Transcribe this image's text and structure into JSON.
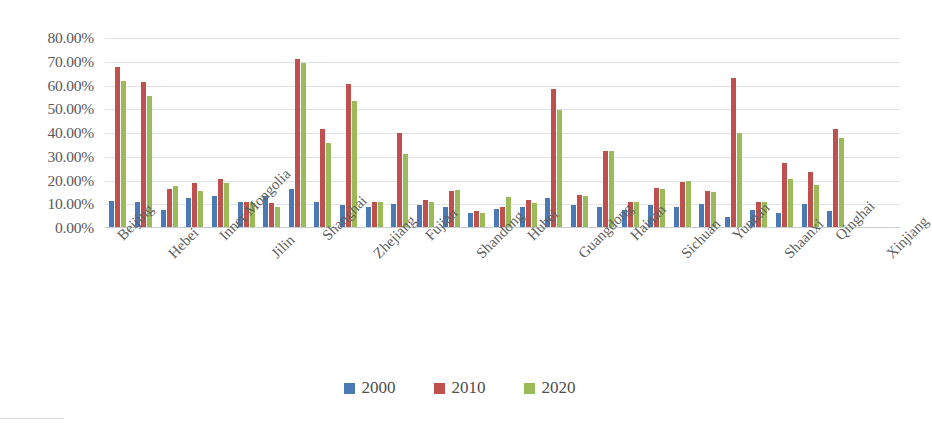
{
  "chart_data": {
    "type": "bar",
    "title": "",
    "subtitle": "",
    "xlabel": "",
    "ylabel": "",
    "ylim": [
      0,
      0.8
    ],
    "grid": true,
    "legend_position": "bottom",
    "y_tick_labels": [
      "80.00%",
      "70.00%",
      "60.00%",
      "50.00%",
      "40.00%",
      "30.00%",
      "20.00%",
      "10.00%",
      "0.00%"
    ],
    "y_tick_values": [
      0.8,
      0.7,
      0.6,
      0.5,
      0.4,
      0.3,
      0.2,
      0.1,
      0.0
    ],
    "categories": [
      "Beijing",
      "Tianjin",
      "Hebei",
      "Shanxi",
      "Inner Mongolia",
      "Liaoning",
      "Jilin",
      "Heilongjiang",
      "Shanghai",
      "Jiangsu",
      "Zhejiang",
      "Anhui",
      "Fujian",
      "Jiangxi",
      "Shandong",
      "Henan",
      "Hubei",
      "Hunan",
      "Guangdong",
      "Guangxi",
      "Hainan",
      "Chongqing",
      "Sichuan",
      "Guizhou",
      "Yunnan",
      "Tibet",
      "Shaanxi",
      "Gansu",
      "Qinghai",
      "Ningxia",
      "Xinjiang"
    ],
    "visible_tick_labels": [
      "Beijing",
      "Hebei",
      "Inner Mongolia",
      "Jilin",
      "Shanghai",
      "Zhejiang",
      "Fujian",
      "Shandong",
      "Hubei",
      "Guangdong",
      "Hainan",
      "Sichuan",
      "Yunnan",
      "Shaanxi",
      "Qinghai",
      "Xinjiang"
    ],
    "series": [
      {
        "name": "2000",
        "color": "#4a7ab5",
        "values": [
          0.115,
          0.11,
          0.075,
          0.125,
          0.135,
          0.11,
          0.135,
          0.165,
          0.11,
          0.095,
          0.09,
          0.1,
          0.095,
          0.09,
          0.065,
          0.08,
          0.09,
          0.125,
          0.095,
          0.09,
          0.075,
          0.095,
          0.09,
          0.1,
          0.045,
          0.075,
          0.065,
          0.1,
          0.07,
          0.0,
          0.0
        ]
      },
      {
        "name": "2010",
        "color": "#c0504d",
        "values": [
          0.68,
          0.615,
          0.165,
          0.19,
          0.205,
          0.11,
          0.105,
          0.71,
          0.415,
          0.605,
          0.11,
          0.4,
          0.12,
          0.155,
          0.07,
          0.09,
          0.12,
          0.585,
          0.14,
          0.325,
          0.11,
          0.17,
          0.195,
          0.155,
          0.63,
          0.11,
          0.275,
          0.235,
          0.415,
          0.0,
          0.0
        ]
      },
      {
        "name": "2020",
        "color": "#9bbb59",
        "values": [
          0.62,
          0.555,
          0.175,
          0.155,
          0.19,
          0.105,
          0.09,
          0.695,
          0.36,
          0.535,
          0.11,
          0.31,
          0.11,
          0.16,
          0.065,
          0.13,
          0.105,
          0.495,
          0.135,
          0.325,
          0.11,
          0.165,
          0.2,
          0.15,
          0.4,
          0.11,
          0.205,
          0.18,
          0.38,
          0.0,
          0.0
        ]
      }
    ],
    "legend": [
      {
        "label": "2000",
        "color": "#4a7ab5"
      },
      {
        "label": "2010",
        "color": "#c0504d"
      },
      {
        "label": "2020",
        "color": "#9bbb59"
      }
    ]
  }
}
